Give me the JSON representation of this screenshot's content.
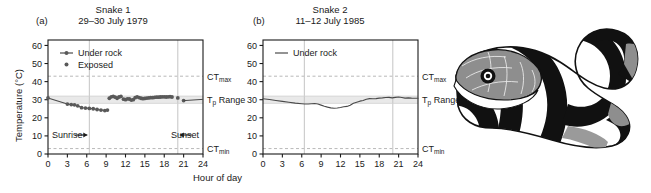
{
  "figure": {
    "xlabel": "Hour of day",
    "ylabel": "Temperature (°C)"
  },
  "annotations": {
    "ctmax_main": "CT",
    "ctmax_sub": "max",
    "ctmin_main": "CT",
    "ctmin_sub": "min",
    "tp_main_a": "T",
    "tp_sub": "p",
    "tp_main_b": " Range",
    "sunrise": "Sunrise",
    "sunrise_arrow": "▶",
    "sunset": "Sunset",
    "sunset_arrow": "◀"
  },
  "panel_a": {
    "label": "(a)",
    "title_line1": "Snake 1",
    "title_line2": "29–30 July 1979",
    "legend": [
      {
        "label": "Under rock",
        "style": "line-marker"
      },
      {
        "label": "Exposed",
        "style": "marker"
      }
    ]
  },
  "panel_b": {
    "label": "(b)",
    "title_line1": "Snake 2",
    "title_line2": "11–12 July 1985",
    "legend": [
      {
        "label": "Under rock",
        "style": "line"
      }
    ]
  },
  "chart_data": [
    {
      "type": "scatter",
      "panel": "(a)",
      "title": "Snake 1 — 29–30 July 1979",
      "xlabel": "Hour of day",
      "ylabel": "Temperature (°C)",
      "xlim": [
        0,
        24
      ],
      "ylim": [
        0,
        63
      ],
      "xticks": [
        0,
        3,
        6,
        9,
        12,
        15,
        18,
        21,
        24
      ],
      "yticks": [
        0,
        10,
        20,
        30,
        40,
        50,
        60
      ],
      "grid": false,
      "legend_position": "top-left inside axes",
      "reference_lines": {
        "ctmax": 43,
        "ctmin": 3,
        "tp_range": [
          28,
          32
        ],
        "sunrise_hour": 6.4,
        "sunset_hour": 20.1
      },
      "series": [
        {
          "name": "Under rock",
          "marker": "filled-circle",
          "connected": true,
          "x": [
            0.0,
            3.0,
            3.6,
            4.1,
            4.6,
            5.2,
            5.8,
            6.4,
            7.0,
            7.6,
            8.2,
            8.8,
            9.2
          ],
          "y": [
            31.0,
            27.6,
            27.3,
            27.2,
            26.6,
            25.6,
            25.4,
            25.2,
            25.0,
            24.6,
            24.3,
            24.0,
            24.3
          ]
        },
        {
          "name": "Exposed",
          "marker": "filled-circle",
          "connected": false,
          "x": [
            9.5,
            9.8,
            10.1,
            10.4,
            10.7,
            11.0,
            11.3,
            11.7,
            12.0,
            12.3,
            12.6,
            12.9,
            13.2,
            13.5,
            13.8,
            14.1,
            14.4,
            14.7,
            15.0,
            15.3,
            15.6,
            15.9,
            16.2,
            16.5,
            16.8,
            17.1,
            17.4,
            17.7,
            18.0,
            18.3,
            18.6,
            18.9,
            19.2,
            20.1,
            21.0
          ],
          "y": [
            30.8,
            31.6,
            31.9,
            31.4,
            30.8,
            31.5,
            31.8,
            30.3,
            30.0,
            30.5,
            30.4,
            29.8,
            30.0,
            31.1,
            31.6,
            31.2,
            30.8,
            30.6,
            30.7,
            30.9,
            31.0,
            31.2,
            31.1,
            31.3,
            31.4,
            31.4,
            31.5,
            31.6,
            31.6,
            31.5,
            31.6,
            31.7,
            31.5,
            31.0,
            29.5
          ]
        }
      ]
    },
    {
      "type": "line",
      "panel": "(b)",
      "title": "Snake 2 — 11–12 July 1985",
      "xlabel": "Hour of day",
      "ylabel": "Temperature (°C)",
      "xlim": [
        0,
        24
      ],
      "ylim": [
        0,
        63
      ],
      "xticks": [
        0,
        3,
        6,
        9,
        12,
        15,
        18,
        21,
        24
      ],
      "yticks": [
        0,
        10,
        20,
        30,
        40,
        50,
        60
      ],
      "grid": false,
      "legend_position": "top-left inside axes",
      "reference_lines": {
        "ctmax": 43,
        "ctmin": 3,
        "tp_range": [
          28,
          32
        ],
        "sunrise_hour": 6.4,
        "sunset_hour": 20.1
      },
      "series": [
        {
          "name": "Under rock",
          "marker": "none",
          "connected": true,
          "x": [
            0.0,
            1.0,
            2.0,
            3.0,
            4.0,
            5.0,
            6.0,
            6.5,
            7.0,
            7.5,
            8.0,
            8.5,
            9.0,
            9.5,
            10.0,
            10.5,
            11.0,
            11.5,
            12.0,
            12.5,
            13.0,
            13.5,
            14.0,
            14.5,
            15.0,
            15.5,
            16.0,
            16.5,
            17.0,
            17.5,
            18.0,
            18.5,
            19.0,
            19.5,
            20.0,
            20.5,
            21.0,
            21.5,
            22.0,
            22.5,
            23.0,
            24.0
          ],
          "y": [
            30.5,
            30.1,
            29.6,
            29.1,
            28.6,
            28.1,
            27.8,
            27.6,
            27.6,
            27.8,
            27.9,
            27.6,
            27.0,
            26.4,
            25.9,
            25.5,
            25.3,
            25.4,
            25.7,
            26.1,
            26.3,
            26.9,
            28.0,
            28.6,
            29.2,
            29.6,
            30.3,
            30.6,
            30.5,
            30.6,
            30.9,
            31.0,
            31.2,
            31.3,
            31.0,
            31.3,
            31.5,
            31.2,
            30.9,
            31.0,
            30.9,
            30.8
          ]
        }
      ]
    }
  ]
}
